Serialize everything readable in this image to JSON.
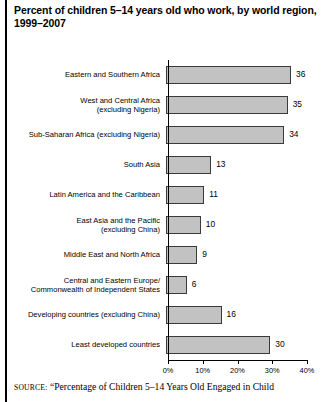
{
  "title": {
    "line1": "Percent of children 5–14 years old who work, by world region,",
    "line2": "1999–2007"
  },
  "source": {
    "label": "SOURCE:",
    "text": "“Percentage of Children 5–14 Years Old Engaged in Child"
  },
  "colors": {
    "bar_fill": "#c2c2c2",
    "bar_border": "#3a3a3a",
    "axis": "#000000",
    "text": "#000000"
  },
  "chart_data": {
    "type": "bar",
    "orientation": "horizontal",
    "title": "Percent of children 5–14 years old who work, by world region, 1999–2007",
    "xlabel": "",
    "ylabel": "",
    "xlim": [
      0,
      40
    ],
    "grid": false,
    "legend": null,
    "tick_labels": [
      "0%",
      "10%",
      "20%",
      "30%",
      "40%"
    ],
    "tick_values": [
      0,
      10,
      20,
      30,
      40
    ],
    "categories": [
      "Eastern and Southern Africa",
      "West and Central Africa (excluding Nigeria)",
      "Sub-Saharan Africa (excluding Nigeria)",
      "South Asia",
      "Latin America and the Caribbean",
      "East Asia and the Pacific (excluding China)",
      "Middle East and North Africa",
      "Central and Eastern Europe/Commonwealth of Independent States",
      "Developing countries (excluding China)",
      "Least developed countries"
    ],
    "values": [
      36,
      35,
      34,
      13,
      11,
      10,
      9,
      6,
      16,
      30
    ],
    "value_labels": [
      "36",
      "35",
      "34",
      "13",
      "11",
      "10",
      "9",
      "6",
      "16",
      "30"
    ]
  },
  "rows": [
    {
      "label_line1": "Eastern and Southern Africa",
      "label_line2": "",
      "value": 36,
      "value_label": "36"
    },
    {
      "label_line1": "West and Central Africa",
      "label_line2": "(excluding Nigeria)",
      "value": 35,
      "value_label": "35"
    },
    {
      "label_line1": "Sub-Saharan Africa (excluding Nigeria)",
      "label_line2": "",
      "value": 34,
      "value_label": "34"
    },
    {
      "label_line1": "South Asia",
      "label_line2": "",
      "value": 13,
      "value_label": "13"
    },
    {
      "label_line1": "Latin America and the Caribbean",
      "label_line2": "",
      "value": 11,
      "value_label": "11"
    },
    {
      "label_line1": "East Asia and the Pacific",
      "label_line2": "(excluding China)",
      "value": 10,
      "value_label": "10"
    },
    {
      "label_line1": "Middle East and North Africa",
      "label_line2": "",
      "value": 9,
      "value_label": "9"
    },
    {
      "label_line1": "Central and Eastern Europe/",
      "label_line2": "Commonwealth of Independent States",
      "value": 6,
      "value_label": "6"
    },
    {
      "label_line1": "Developing countries (excluding China)",
      "label_line2": "",
      "value": 16,
      "value_label": "16"
    },
    {
      "label_line1": "Least developed countries",
      "label_line2": "",
      "value": 30,
      "value_label": "30"
    }
  ]
}
